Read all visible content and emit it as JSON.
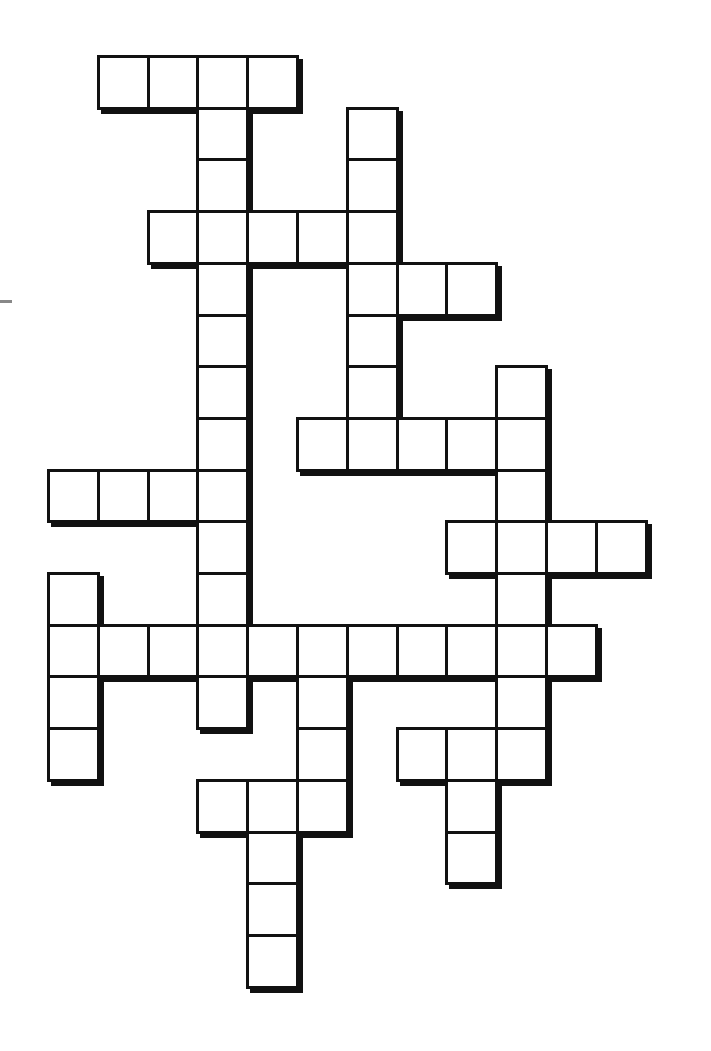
{
  "puzzle": {
    "type": "crossword",
    "grid": {
      "origin_x": 47,
      "origin_y": 55,
      "cell_w": 49.8,
      "cell_h": 51.7,
      "border_color": "#111111",
      "fill_color": "#ffffff"
    },
    "entries": [
      {
        "dir": "across",
        "row": 0,
        "col": 1,
        "len": 4
      },
      {
        "dir": "down",
        "row": 0,
        "col": 3,
        "len": 13
      },
      {
        "dir": "down",
        "row": 1,
        "col": 6,
        "len": 6
      },
      {
        "dir": "across",
        "row": 3,
        "col": 2,
        "len": 5
      },
      {
        "dir": "across",
        "row": 4,
        "col": 6,
        "len": 3
      },
      {
        "dir": "down",
        "row": 6,
        "col": 9,
        "len": 8
      },
      {
        "dir": "across",
        "row": 7,
        "col": 5,
        "len": 5
      },
      {
        "dir": "across",
        "row": 8,
        "col": 0,
        "len": 4
      },
      {
        "dir": "across",
        "row": 9,
        "col": 8,
        "len": 4
      },
      {
        "dir": "down",
        "row": 10,
        "col": 0,
        "len": 4
      },
      {
        "dir": "across",
        "row": 11,
        "col": 0,
        "len": 11
      },
      {
        "dir": "down",
        "row": 11,
        "col": 5,
        "len": 4
      },
      {
        "dir": "across",
        "row": 13,
        "col": 7,
        "len": 3
      },
      {
        "dir": "down",
        "row": 13,
        "col": 8,
        "len": 3
      },
      {
        "dir": "across",
        "row": 14,
        "col": 3,
        "len": 3
      },
      {
        "dir": "down",
        "row": 14,
        "col": 4,
        "len": 4
      }
    ]
  }
}
